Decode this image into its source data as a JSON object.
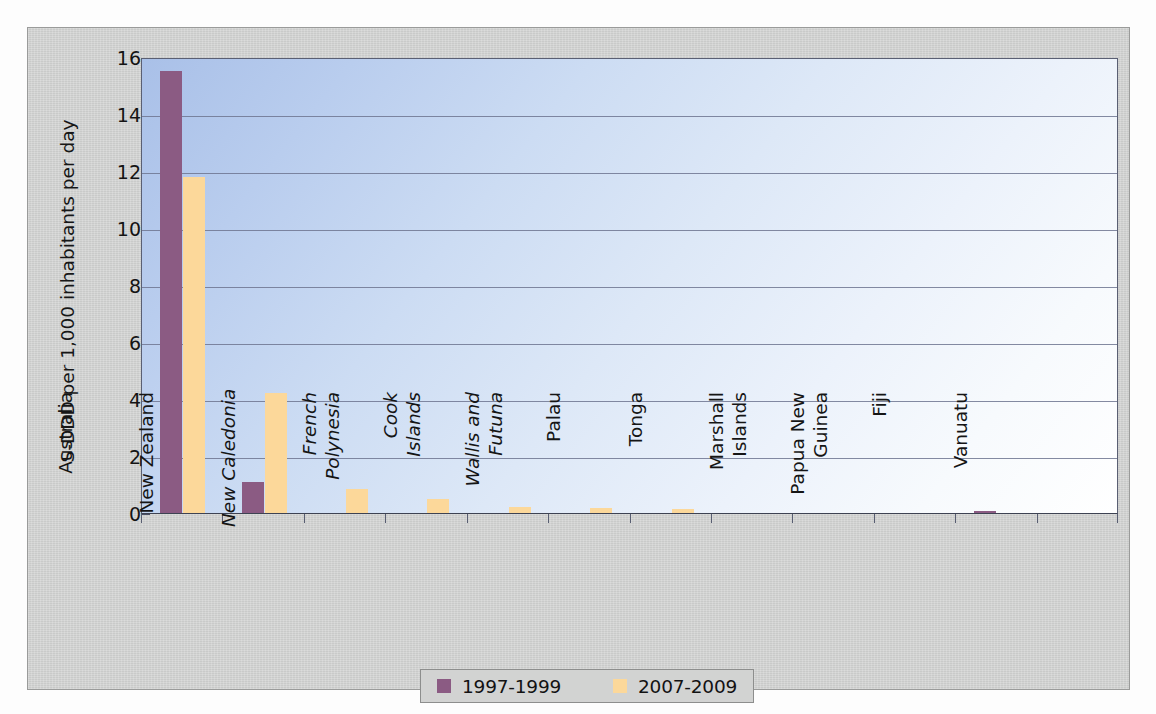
{
  "chart_data": {
    "type": "bar",
    "title": "",
    "subtitle": "",
    "xlabel": "",
    "ylabel": "S-DDD per 1,000 inhabitants per day",
    "ylim": [
      0,
      16
    ],
    "ytick_values": [
      0,
      2,
      4,
      6,
      8,
      10,
      12,
      14,
      16
    ],
    "ytick_labels": [
      "0",
      "2",
      "4",
      "6",
      "8",
      "10",
      "12",
      "14",
      "16"
    ],
    "grid": "horizontal",
    "legend_position": "bottom-center",
    "categories": [
      "Australia",
      "New Zealand",
      "New Caledonia",
      "French Polynesia",
      "Cook Islands",
      "Wallis and Futuna",
      "Palau",
      "Tonga",
      "Marshall Islands",
      "Papua New Guinea",
      "Fiji",
      "Vanuatu"
    ],
    "category_lines": [
      [
        "Australia"
      ],
      [
        "New Zealand"
      ],
      [
        "New Caledonia"
      ],
      [
        "French",
        "Polynesia"
      ],
      [
        "Cook",
        "Islands"
      ],
      [
        "Wallis and",
        "Futuna"
      ],
      [
        "Palau"
      ],
      [
        "Tonga"
      ],
      [
        "Marshall",
        "Islands"
      ],
      [
        "Papua New",
        "Guinea"
      ],
      [
        "Fiji"
      ],
      [
        "Vanuatu"
      ]
    ],
    "category_italic": [
      false,
      false,
      true,
      true,
      true,
      true,
      false,
      false,
      false,
      false,
      false,
      false
    ],
    "series": [
      {
        "name": "1997-1999",
        "color": "#8b5b83",
        "values": [
          15.5,
          1.1,
          0,
          0,
          0,
          0,
          0,
          0,
          0,
          0,
          0.05,
          0
        ]
      },
      {
        "name": "2007-2009",
        "color": "#fcd89a",
        "values": [
          11.8,
          4.2,
          0.85,
          0.5,
          0.22,
          0.18,
          0.15,
          0,
          0,
          0,
          0,
          0
        ]
      }
    ]
  },
  "legend": {
    "items": [
      {
        "label": "1997-1999",
        "color": "#8b5b83"
      },
      {
        "label": "2007-2009",
        "color": "#fcd89a"
      }
    ]
  },
  "colors": {
    "series_a": "#8b5b83",
    "series_b": "#fcd89a",
    "plot_background_top": "#a9c0e8",
    "plot_background_bottom": "#ffffff",
    "frame_background": "#cfd0cf",
    "gridline": "#6f7690",
    "axis": "#4a5064"
  }
}
